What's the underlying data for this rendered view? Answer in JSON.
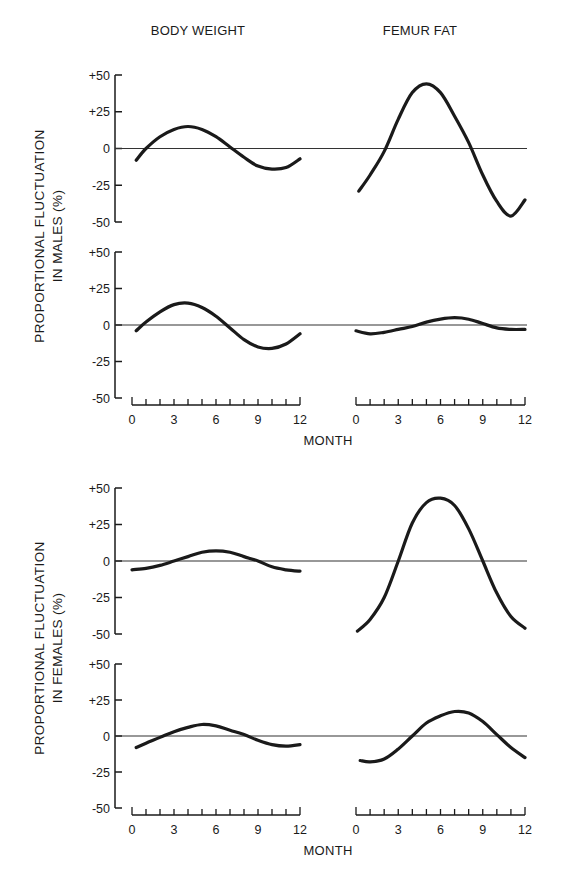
{
  "chart_data": {
    "type": "line",
    "columns": [
      "BODY WEIGHT",
      "FEMUR FAT"
    ],
    "xlabel": "MONTH",
    "xticks": [
      0,
      3,
      6,
      9,
      12
    ],
    "xlim": [
      0,
      12
    ],
    "ylim": [
      -50,
      50
    ],
    "yticks": [
      "+50",
      "+25",
      "0",
      "-25",
      "-50"
    ],
    "grid": false,
    "groups": [
      {
        "ylabel_line1": "PROPORTIONAL FLUCTUATION",
        "ylabel_line2": "IN MALES (%)",
        "panels": [
          {
            "row": 1,
            "column": "BODY WEIGHT",
            "x": [
              0.3,
              1,
              2,
              3,
              4,
              5,
              6,
              7,
              8,
              9,
              10,
              11,
              12
            ],
            "y": [
              -8,
              0,
              8,
              13,
              15,
              13,
              8,
              1,
              -6,
              -12,
              -14,
              -13,
              -7
            ]
          },
          {
            "row": 1,
            "column": "FEMUR FAT",
            "x": [
              0.2,
              1,
              2,
              3,
              4,
              5,
              6,
              7,
              8,
              9,
              10,
              11,
              12
            ],
            "y": [
              -29,
              -18,
              -2,
              20,
              38,
              44,
              38,
              22,
              4,
              -18,
              -36,
              -46,
              -35
            ]
          },
          {
            "row": 2,
            "column": "BODY WEIGHT",
            "x": [
              0.3,
              1,
              2,
              3,
              4,
              5,
              6,
              7,
              8,
              9,
              10,
              11,
              12
            ],
            "y": [
              -4,
              2,
              9,
              14,
              15,
              12,
              6,
              -2,
              -10,
              -15,
              -16,
              -13,
              -6
            ]
          },
          {
            "row": 2,
            "column": "FEMUR FAT",
            "x": [
              0,
              1,
              2,
              3,
              4,
              5,
              6,
              7,
              8,
              9,
              10,
              11,
              12
            ],
            "y": [
              -4,
              -6,
              -5,
              -3,
              -1,
              2,
              4,
              5,
              4,
              1,
              -2,
              -3,
              -3
            ]
          }
        ]
      },
      {
        "ylabel_line1": "PROPORTIONAL FLUCTUATION",
        "ylabel_line2": "IN FEMALES (%)",
        "panels": [
          {
            "row": 1,
            "column": "BODY WEIGHT",
            "x": [
              0,
              1,
              2,
              3,
              4,
              5,
              6,
              7,
              8,
              9,
              10,
              11,
              12
            ],
            "y": [
              -6,
              -5,
              -3,
              0,
              3,
              6,
              7,
              6,
              3,
              0,
              -4,
              -6,
              -7
            ]
          },
          {
            "row": 1,
            "column": "FEMUR FAT",
            "x": [
              0.1,
              1,
              2,
              3,
              4,
              5,
              6,
              7,
              8,
              9,
              10,
              11,
              12
            ],
            "y": [
              -48,
              -40,
              -25,
              0,
              26,
              40,
              43,
              38,
              22,
              0,
              -22,
              -38,
              -46
            ]
          },
          {
            "row": 2,
            "column": "BODY WEIGHT",
            "x": [
              0.3,
              1,
              2,
              3,
              4,
              5,
              6,
              7,
              8,
              9,
              10,
              11,
              12
            ],
            "y": [
              -8,
              -5,
              -1,
              3,
              6,
              8,
              7,
              4,
              1,
              -3,
              -6,
              -7,
              -6
            ]
          },
          {
            "row": 2,
            "column": "FEMUR FAT",
            "x": [
              0.3,
              1,
              2,
              3,
              4,
              5,
              6,
              7,
              8,
              9,
              10,
              11,
              12
            ],
            "y": [
              -17,
              -18,
              -16,
              -9,
              0,
              9,
              14,
              17,
              16,
              10,
              1,
              -8,
              -15
            ]
          }
        ]
      }
    ]
  },
  "labels": {
    "col_body_weight": "BODY WEIGHT",
    "col_femur_fat": "FEMUR FAT",
    "month": "MONTH",
    "males_line1": "PROPORTIONAL FLUCTUATION",
    "males_line2": "IN MALES (%)",
    "females_line1": "PROPORTIONAL FLUCTUATION",
    "females_line2": "IN FEMALES (%)",
    "ytick_p50": "+50",
    "ytick_p25": "+25",
    "ytick_0": "0",
    "ytick_m25": "-25",
    "ytick_m50": "-50",
    "xtick_0": "0",
    "xtick_3": "3",
    "xtick_6": "6",
    "xtick_9": "9",
    "xtick_12": "12"
  },
  "colors": {
    "ink": "#1a1a1a",
    "zero_line": "#333333",
    "background": "#ffffff"
  }
}
